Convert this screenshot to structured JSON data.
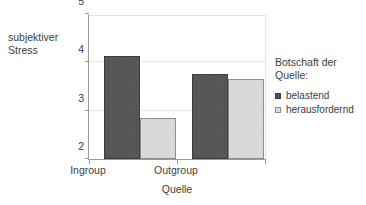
{
  "chart_data": {
    "type": "bar",
    "title": "",
    "xlabel": "Quelle",
    "ylabel": "subjektiver\nStress",
    "categories": [
      "Ingroup",
      "Outgroup"
    ],
    "series": [
      {
        "name": "belastend",
        "values": [
          4.13,
          3.75
        ],
        "color": "#4e4e4e"
      },
      {
        "name": "herausfordernd",
        "values": [
          2.85,
          3.65
        ],
        "color": "#dcdcdc"
      }
    ],
    "ylim": [
      2,
      5
    ],
    "yticks": [
      "2",
      "3",
      "4",
      "5"
    ],
    "ytick_values": [
      2,
      3,
      4,
      5
    ],
    "grid": true,
    "legend_position": "right",
    "legend_title": "Botschaft der\nQuelle:"
  },
  "axis": {
    "y_title": "subjektiver\nStress",
    "x_title": "Quelle",
    "y_ticks": [
      "2",
      "3",
      "4",
      "5"
    ],
    "x_ticks": [
      "Ingroup",
      "Outgroup"
    ]
  },
  "legend": {
    "title": "Botschaft der\nQuelle:",
    "items": [
      {
        "label": "belastend",
        "swatch": "dark-square-marker"
      },
      {
        "label": "herausfordernd",
        "swatch": "light-square-marker"
      }
    ]
  }
}
